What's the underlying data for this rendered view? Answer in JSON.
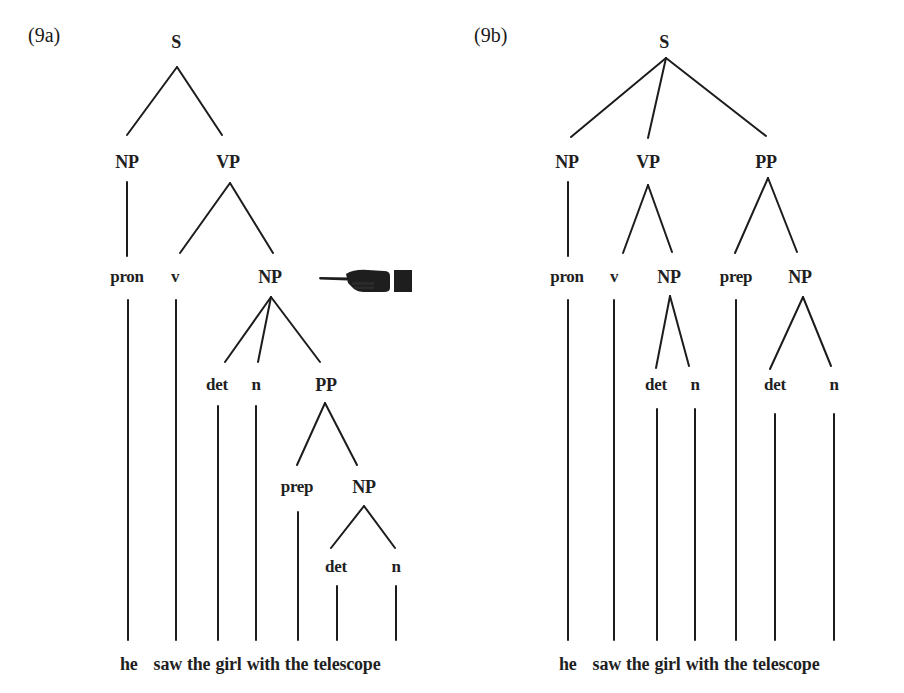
{
  "figure": {
    "width": 904,
    "height": 693,
    "line_color": "#1c1c1c",
    "text_color": "#1f1f1f"
  },
  "trees": [
    {
      "id": "9a",
      "label": "(9a)",
      "label_pos": [
        28,
        25
      ],
      "nodes": [
        {
          "id": "S",
          "text": "S",
          "x": 176,
          "y": 42,
          "cat": true
        },
        {
          "id": "NP1",
          "text": "NP",
          "x": 127,
          "y": 162,
          "cat": true
        },
        {
          "id": "VP",
          "text": "VP",
          "x": 228,
          "y": 162,
          "cat": true
        },
        {
          "id": "pron",
          "text": "pron",
          "x": 127,
          "y": 277,
          "cat": false
        },
        {
          "id": "v",
          "text": "v",
          "x": 175,
          "y": 277,
          "cat": false
        },
        {
          "id": "NP2",
          "text": "NP",
          "x": 270,
          "y": 277,
          "cat": true
        },
        {
          "id": "det1",
          "text": "det",
          "x": 217,
          "y": 385,
          "cat": false
        },
        {
          "id": "n1",
          "text": "n",
          "x": 256,
          "y": 385,
          "cat": false
        },
        {
          "id": "PP",
          "text": "PP",
          "x": 326,
          "y": 385,
          "cat": true
        },
        {
          "id": "prep",
          "text": "prep",
          "x": 297,
          "y": 487,
          "cat": false
        },
        {
          "id": "NP3",
          "text": "NP",
          "x": 364,
          "y": 487,
          "cat": true
        },
        {
          "id": "det2",
          "text": "det",
          "x": 336,
          "y": 567,
          "cat": false
        },
        {
          "id": "n2",
          "text": "n",
          "x": 396,
          "y": 567,
          "cat": false
        }
      ],
      "edges": [
        [
          177,
          67,
          127,
          135
        ],
        [
          177,
          67,
          222,
          135
        ],
        [
          127,
          182,
          127,
          256
        ],
        [
          230,
          183,
          180,
          253
        ],
        [
          230,
          183,
          273,
          253
        ],
        [
          271,
          297,
          225,
          362
        ],
        [
          271,
          297,
          258,
          362
        ],
        [
          271,
          297,
          320,
          362
        ],
        [
          325,
          403,
          297,
          465
        ],
        [
          325,
          403,
          357,
          465
        ],
        [
          364,
          506,
          331,
          548
        ],
        [
          364,
          506,
          395,
          548
        ],
        [
          128,
          300,
          128,
          640
        ],
        [
          176,
          300,
          176,
          640
        ],
        [
          218,
          406,
          218,
          640
        ],
        [
          256,
          406,
          256,
          640
        ],
        [
          298,
          512,
          298,
          640
        ],
        [
          337,
          586,
          337,
          640
        ],
        [
          396,
          586,
          396,
          640
        ]
      ],
      "sentence": {
        "x": 120,
        "y": 654,
        "words": [
          "he",
          "saw",
          "the",
          "girl",
          "with",
          "the",
          "telescope"
        ]
      },
      "pointer": {
        "icon": "pointing-hand-icon",
        "x": 318,
        "y": 268,
        "width": 96,
        "height": 26,
        "color": "#1e1e1e"
      }
    },
    {
      "id": "9b",
      "label": "(9b)",
      "label_pos": [
        474,
        25
      ],
      "nodes": [
        {
          "id": "S",
          "text": "S",
          "x": 664,
          "y": 42,
          "cat": true
        },
        {
          "id": "NP1",
          "text": "NP",
          "x": 567,
          "y": 162,
          "cat": true
        },
        {
          "id": "VP",
          "text": "VP",
          "x": 648,
          "y": 162,
          "cat": true
        },
        {
          "id": "PP",
          "text": "PP",
          "x": 766,
          "y": 162,
          "cat": true
        },
        {
          "id": "pron",
          "text": "pron",
          "x": 567,
          "y": 277,
          "cat": false
        },
        {
          "id": "v",
          "text": "v",
          "x": 614,
          "y": 277,
          "cat": false
        },
        {
          "id": "NP2",
          "text": "NP",
          "x": 669,
          "y": 277,
          "cat": true
        },
        {
          "id": "prep",
          "text": "prep",
          "x": 736,
          "y": 277,
          "cat": false
        },
        {
          "id": "NP3",
          "text": "NP",
          "x": 800,
          "y": 277,
          "cat": true
        },
        {
          "id": "det1",
          "text": "det",
          "x": 656,
          "y": 385,
          "cat": false
        },
        {
          "id": "n1",
          "text": "n",
          "x": 695,
          "y": 385,
          "cat": false
        },
        {
          "id": "det2",
          "text": "det",
          "x": 775,
          "y": 385,
          "cat": false
        },
        {
          "id": "n2",
          "text": "n",
          "x": 834,
          "y": 385,
          "cat": false
        }
      ],
      "edges": [
        [
          666,
          58,
          571,
          137
        ],
        [
          666,
          58,
          648,
          138
        ],
        [
          666,
          58,
          766,
          136
        ],
        [
          568,
          182,
          568,
          256
        ],
        [
          648,
          185,
          623,
          253
        ],
        [
          648,
          185,
          672,
          252
        ],
        [
          768,
          178,
          735,
          253
        ],
        [
          768,
          178,
          797,
          252
        ],
        [
          670,
          296,
          656,
          368
        ],
        [
          670,
          296,
          689,
          366
        ],
        [
          803,
          297,
          770,
          369
        ],
        [
          803,
          297,
          831,
          366
        ],
        [
          568,
          300,
          568,
          640
        ],
        [
          614,
          300,
          614,
          640
        ],
        [
          736,
          300,
          736,
          640
        ],
        [
          657,
          409,
          657,
          640
        ],
        [
          695,
          409,
          695,
          640
        ],
        [
          775,
          414,
          775,
          640
        ],
        [
          834,
          414,
          834,
          640
        ]
      ],
      "sentence": {
        "x": 559,
        "y": 654,
        "words": [
          "he",
          "saw",
          "the",
          "girl",
          "with",
          "the",
          "telescope"
        ]
      }
    }
  ]
}
